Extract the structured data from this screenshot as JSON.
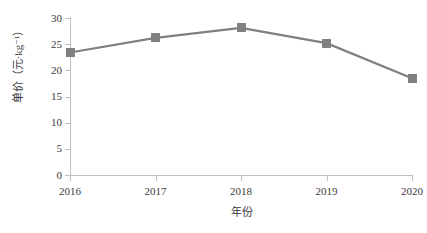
{
  "chart_data": {
    "type": "line",
    "title": "",
    "xlabel": "年份",
    "ylabel": "单价（元·kg⁻¹）",
    "categories": [
      "2016",
      "2017",
      "2018",
      "2019",
      "2020"
    ],
    "values": [
      23.4,
      26.2,
      28.1,
      25.2,
      18.5
    ],
    "series": [
      {
        "name": "单价",
        "values": [
          23.4,
          26.2,
          28.1,
          25.2,
          18.5
        ],
        "color": "#808080",
        "marker": "square"
      }
    ],
    "ylim": [
      0,
      30
    ],
    "y_ticks": [
      "0",
      "5",
      "10",
      "15",
      "20",
      "25",
      "30"
    ],
    "y_tick_values": [
      0,
      5,
      10,
      15,
      20,
      25,
      30
    ],
    "x_ticks": [
      "2016",
      "2017",
      "2018",
      "2019",
      "2020"
    ],
    "grid": false,
    "legend": "none",
    "background": "#ffffff",
    "axis_color": "#bfbfbf",
    "text_color": "#3a3a3a",
    "line_color": "#808080",
    "marker_color": "#808080"
  }
}
